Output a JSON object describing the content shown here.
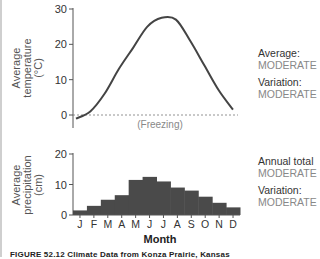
{
  "chart_data": [
    {
      "type": "line",
      "title": "",
      "xlabel": "",
      "ylabel": "Average temperature (°C)",
      "ylim": [
        -2,
        30
      ],
      "yticks": [
        0,
        10,
        20,
        30
      ],
      "grid": false,
      "reference_line": {
        "y": 0,
        "label": "(Freezing)",
        "style": "dashed"
      },
      "x": [
        1,
        2,
        3,
        4,
        5,
        6,
        7,
        8,
        9,
        10,
        11,
        12
      ],
      "categories": [
        "J",
        "F",
        "M",
        "A",
        "M",
        "J",
        "J",
        "A",
        "S",
        "O",
        "N",
        "D"
      ],
      "values": [
        -1,
        1,
        6,
        13,
        19,
        25,
        27.5,
        27,
        21,
        14,
        7,
        1.5
      ],
      "annotations": {
        "average": "MODERATE",
        "variation": "MODERATE"
      }
    },
    {
      "type": "bar",
      "title": "",
      "xlabel": "Month",
      "ylabel": "Average precipitation (cm)",
      "ylim": [
        0,
        20
      ],
      "yticks": [
        0,
        10,
        20
      ],
      "grid": false,
      "categories": [
        "J",
        "F",
        "M",
        "A",
        "M",
        "J",
        "J",
        "A",
        "S",
        "O",
        "N",
        "D"
      ],
      "values": [
        1.5,
        3,
        5,
        6.5,
        11.5,
        12.5,
        11,
        9,
        8,
        6,
        4,
        2.5
      ],
      "annotations": {
        "annual_total": "MODERATE",
        "variation": "MODERATE"
      }
    }
  ],
  "top_chart": {
    "ylabel_lines": [
      "Average",
      "temperature",
      "(°C)"
    ],
    "yticks": [
      "30",
      "20",
      "10",
      "0"
    ],
    "freezing_label": "(Freezing)",
    "side": {
      "label1": "Average:",
      "value1": "MODERATE",
      "label2": "Variation:",
      "value2": "MODERATE"
    }
  },
  "bottom_chart": {
    "ylabel_lines": [
      "Average",
      "precipitation",
      "(cm)"
    ],
    "yticks": [
      "20",
      "10",
      "0"
    ],
    "months": [
      "J",
      "F",
      "M",
      "A",
      "M",
      "J",
      "J",
      "A",
      "S",
      "O",
      "N",
      "D"
    ],
    "xlabel": "Month",
    "side": {
      "label1": "Annual total",
      "value1": "MODERATE",
      "label2": "Variation:",
      "value2": "MODERATE"
    }
  },
  "caption": "FIGURE 52.12 Climate Data from Konza Prairie, Kansas"
}
